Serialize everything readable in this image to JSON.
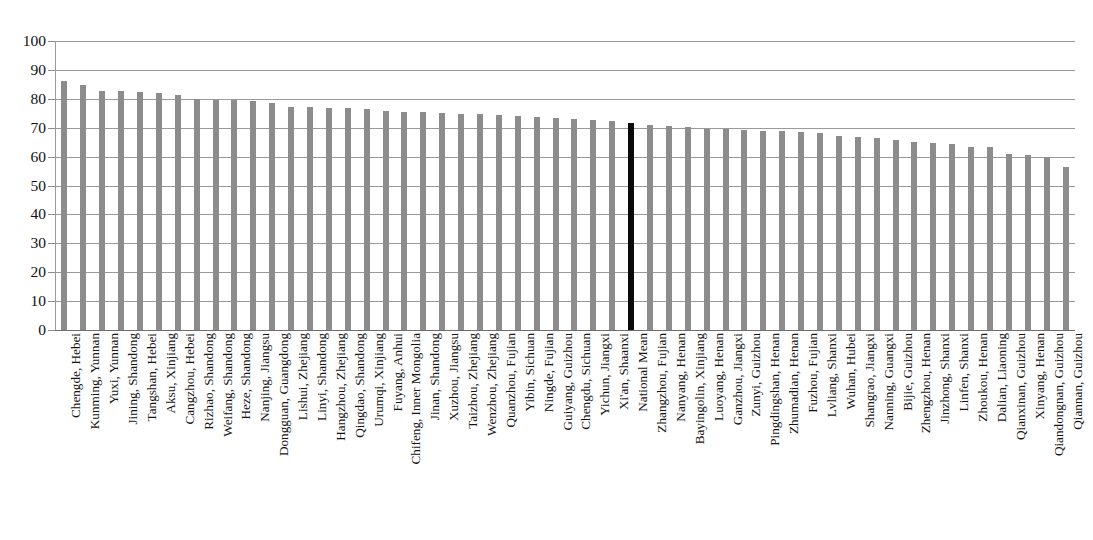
{
  "chart_data": {
    "type": "bar",
    "title": "",
    "subtitle": "",
    "xlabel": "",
    "ylabel": "",
    "ylim": [
      0,
      100
    ],
    "yticks": [
      0,
      10,
      20,
      30,
      40,
      50,
      60,
      70,
      80,
      90,
      100
    ],
    "grid": true,
    "legend": null,
    "bar_color": "#8c8c8c",
    "highlight_color": "#0a0a0a",
    "highlight_category": "National Mean",
    "categories": [
      "Chengde, Hebei",
      "Kunming, Yunnan",
      "Yuxi, Yunnan",
      "Jining, Shandong",
      "Tangshan, Hebei",
      "Aksu, Xinjiang",
      "Cangzhou, Hebei",
      "Rizhao, Shandong",
      "Weifang, Shandong",
      "Heze, Shandong",
      "Nanjing, Jiangsu",
      "Dongguan, Guangdong",
      "Lishui, Zhejiang",
      "Linyi, Shandong",
      "Hangzhou, Zhejiang",
      "Qingdao, Shandong",
      "Urumqi, Xinjiang",
      "Fuyang, Anhui",
      "Chifeng, Inner Mongolia",
      "Jinan, Shandong",
      "Xuzhou, Jiangsu",
      "Taizhou, Zhejiang",
      "Wenzhou, Zhejiang",
      "Quanzhou, Fujian",
      "Yibin, Sichuan",
      "Ningde, Fujian",
      "Guiyang, Guizhou",
      "Chengdu, Sichuan",
      "Yichun, Jiangxi",
      "Xi'an, Shaanxi",
      "National Mean",
      "Zhangzhou, Fujian",
      "Nanyang, Henan",
      "Bayingolin, Xinjiang",
      "Luoyang, Henan",
      "Ganzhou, Jiangxi",
      "Zunyi, Guizhou",
      "Pingdingshan, Henan",
      "Zhumadian, Henan",
      "Fuzhou, Fujian",
      "Lvliang, Shanxi",
      "Wuhan, Hubei",
      "Shangrao, Jiangxi",
      "Nanning, Guangxi",
      "Bijie, Guizhou",
      "Zhengzhou, Henan",
      "Jinzhong, Shanxi",
      "Linfen, Shanxi",
      "Zhoukou, Henan",
      "Dalian, Liaoning",
      "Qianxinan, Guizhou",
      "Xinyang, Henan",
      "Qiandongnan, Guizhou",
      "Qiannan, Guizhou"
    ],
    "values": [
      86.0,
      84.7,
      82.8,
      82.7,
      82.2,
      82.1,
      81.4,
      79.9,
      79.7,
      79.7,
      79.3,
      78.6,
      77.2,
      77.0,
      76.9,
      76.7,
      76.4,
      75.9,
      75.6,
      75.4,
      75.2,
      74.8,
      74.6,
      74.3,
      74.0,
      73.6,
      73.4,
      73.0,
      72.5,
      72.3,
      71.5,
      71.1,
      70.7,
      70.4,
      69.6,
      69.5,
      69.3,
      68.9,
      68.8,
      68.5,
      68.2,
      67.2,
      66.7,
      66.4,
      65.9,
      65.1,
      64.7,
      64.5,
      63.4,
      63.2,
      60.9,
      60.7,
      59.8,
      56.3
    ]
  }
}
